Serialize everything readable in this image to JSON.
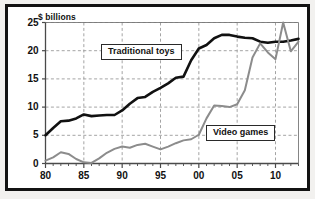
{
  "figure": {
    "y_axis_unit_label": "$ billions",
    "frame_color": "#131313",
    "background_color": "#ffffff"
  },
  "labels": {
    "traditional_toys": "Traditional toys",
    "video_games": "Video games"
  },
  "chart_data": {
    "type": "line",
    "title": "",
    "subtitle": "",
    "xlabel": "",
    "ylabel": "$ billions",
    "ylim": [
      0,
      25
    ],
    "xlim": [
      1980,
      2013
    ],
    "grid": true,
    "grid_style": "dashed",
    "grid_color": "#9a9a9a",
    "legend_position": "inline-annotations",
    "y_ticks": [
      0,
      5,
      10,
      15,
      20,
      25
    ],
    "y_tick_labels": [
      "0",
      "5",
      "10",
      "15",
      "20",
      "25"
    ],
    "x_ticks": [
      1980,
      1985,
      1990,
      1995,
      2000,
      2005,
      2010
    ],
    "x_tick_labels": [
      "80",
      "85",
      "90",
      "95",
      "00",
      "05",
      "10"
    ],
    "x_minor_tick_interval": 1,
    "x": [
      1980,
      1981,
      1982,
      1983,
      1984,
      1985,
      1986,
      1987,
      1988,
      1989,
      1990,
      1991,
      1992,
      1993,
      1994,
      1995,
      1996,
      1997,
      1998,
      1999,
      2000,
      2001,
      2002,
      2003,
      2004,
      2005,
      2006,
      2007,
      2008,
      2009,
      2010,
      2011,
      2012,
      2013
    ],
    "series": [
      {
        "name": "Traditional toys",
        "color": "#111111",
        "line_width": 2.6,
        "values": [
          5.0,
          6.3,
          7.5,
          7.6,
          8.0,
          8.7,
          8.4,
          8.5,
          8.6,
          8.6,
          9.4,
          10.6,
          11.6,
          11.8,
          12.7,
          13.4,
          14.2,
          15.2,
          15.4,
          18.3,
          20.4,
          21.0,
          22.2,
          22.8,
          22.8,
          22.5,
          22.3,
          22.2,
          21.6,
          21.4,
          21.6,
          21.6,
          21.8,
          22.1
        ]
      },
      {
        "name": "Video games",
        "color": "#8c8c8c",
        "line_width": 2.0,
        "values": [
          0.5,
          1.1,
          2.0,
          1.7,
          0.8,
          0.2,
          0.1,
          0.9,
          1.9,
          2.6,
          3.0,
          2.8,
          3.3,
          3.5,
          3.0,
          2.5,
          3.0,
          3.6,
          4.1,
          4.3,
          5.1,
          8.0,
          10.3,
          10.2,
          10.0,
          10.5,
          13.0,
          18.8,
          21.3,
          19.7,
          18.5,
          25.0,
          19.9,
          21.6
        ]
      }
    ],
    "annotations": [
      {
        "text": "Traditional toys",
        "x": 1993,
        "y": 19.0,
        "boxed": true
      },
      {
        "text": "Video games",
        "x": 2006,
        "y": 5.2,
        "boxed": true
      }
    ]
  }
}
